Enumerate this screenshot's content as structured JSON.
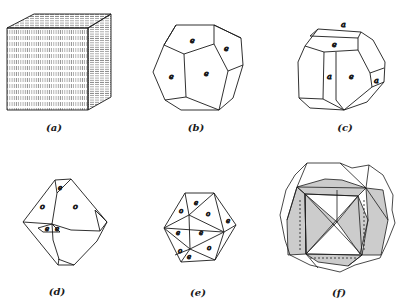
{
  "figure": {
    "panels": [
      {
        "id": "a",
        "caption": "(a)",
        "shape": "cube",
        "face_labels": []
      },
      {
        "id": "b",
        "caption": "(b)",
        "shape": "pentagonal dodecahedron (pyritohedron)",
        "face_labels": [
          "e",
          "e",
          "e",
          "e"
        ]
      },
      {
        "id": "c",
        "caption": "(c)",
        "shape": "pyritohedron modified by cube",
        "face_labels": [
          "a",
          "e",
          "a",
          "e",
          "a"
        ]
      },
      {
        "id": "d",
        "caption": "(d)",
        "shape": "octahedron modified by pyritohedron",
        "face_labels": [
          "e",
          "o",
          "o",
          "e",
          "e"
        ]
      },
      {
        "id": "e",
        "caption": "(e)",
        "shape": "pyritohedron + octahedron (icosahedron-like)",
        "face_labels": [
          "e",
          "o",
          "o",
          "e",
          "e",
          "e",
          "o",
          "o",
          "e"
        ]
      },
      {
        "id": "f",
        "caption": "(f)",
        "shape": "interpenetration twin of pyritohedra (iron cross)",
        "face_labels": []
      }
    ]
  },
  "colors": {
    "line": "#1a1a1a",
    "background": "#ffffff",
    "hatch": "#333333"
  }
}
